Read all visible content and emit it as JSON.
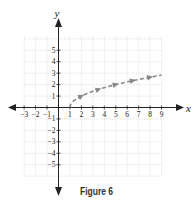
{
  "chart_data": {
    "type": "line",
    "title": "",
    "caption": "Figure 6",
    "xlabel": "x",
    "ylabel": "y",
    "xlim": [
      -3,
      9
    ],
    "ylim": [
      -6,
      6
    ],
    "grid": true,
    "x_ticks": [
      -3,
      -2,
      -1,
      1,
      2,
      3,
      4,
      5,
      6,
      7,
      8,
      9
    ],
    "y_ticks": [
      -5,
      -4,
      -3,
      -2,
      -1,
      1,
      2,
      3,
      4,
      5
    ],
    "series": [
      {
        "name": "curve",
        "style": "dashed",
        "color": "#888888",
        "x": [
          1,
          1.25,
          1.5,
          2,
          2.5,
          3,
          3.5,
          4,
          5,
          6,
          6.5,
          7,
          8,
          9
        ],
        "y": [
          0,
          0.5,
          0.71,
          1,
          1.22,
          1.41,
          1.58,
          1.73,
          2,
          2.24,
          2.35,
          2.45,
          2.65,
          2.83
        ],
        "arrow_markers_at_x": [
          2,
          3.5,
          5,
          6.5,
          8
        ]
      }
    ]
  },
  "caption": "Figure 6",
  "axis_labels": {
    "x": "x",
    "y": "y"
  }
}
